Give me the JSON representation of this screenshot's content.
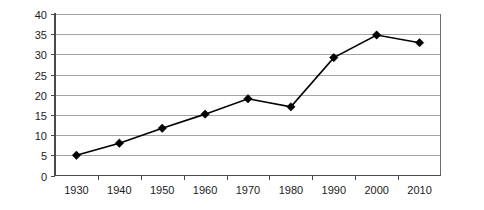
{
  "chart_data": {
    "type": "line",
    "title": "",
    "subtitle": "",
    "xlabel": "",
    "ylabel": "",
    "categories": [
      "1930",
      "1940",
      "1950",
      "1960",
      "1970",
      "1980",
      "1990",
      "2000",
      "2010"
    ],
    "values": [
      5,
      8,
      11.7,
      15.2,
      19,
      17,
      29.2,
      34.8,
      32.9
    ],
    "series": [
      {
        "name": "",
        "values": [
          5,
          8,
          11.7,
          15.2,
          19,
          17,
          29.2,
          34.8,
          32.9
        ],
        "marker": "diamond",
        "line_color": "#000000",
        "marker_color": "#000000"
      }
    ],
    "ylim": [
      0,
      40
    ],
    "ytick_labels": [
      "0",
      "5",
      "10",
      "15",
      "20",
      "25",
      "30",
      "35",
      "40"
    ],
    "ytick_values": [
      0,
      5,
      10,
      15,
      20,
      25,
      30,
      35,
      40
    ],
    "xtick_labels": [
      "1930",
      "1940",
      "1950",
      "1960",
      "1970",
      "1980",
      "1990",
      "2000",
      "2010"
    ],
    "grid": {
      "horizontal": true,
      "vertical": false,
      "color": "#8c8c8c"
    },
    "legend": {
      "visible": false,
      "position": "none",
      "entries": []
    },
    "annotations": [],
    "colors": {
      "background": "#ffffff",
      "axis": "#4a4a4a",
      "gridline": "#8c8c8c",
      "series": "#000000",
      "text": "#1b1b1b"
    }
  }
}
